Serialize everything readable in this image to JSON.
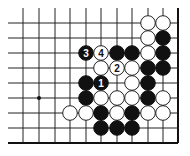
{
  "diagram": {
    "type": "go-board-fragment",
    "grid": {
      "columns_x": [
        23,
        39,
        55,
        70,
        86,
        101,
        117,
        132,
        148,
        163,
        178
      ],
      "rows_y": [
        8,
        23,
        38,
        53,
        68,
        83,
        98,
        113,
        128,
        143
      ],
      "right_edge_x": 178,
      "bottom_edge_y": 143
    },
    "star_points": [
      {
        "x": 39,
        "y": 98
      }
    ],
    "stones": [
      {
        "color": "white",
        "x": 148,
        "y": 23,
        "label": ""
      },
      {
        "color": "white",
        "x": 163,
        "y": 23,
        "label": ""
      },
      {
        "color": "white",
        "x": 148,
        "y": 38,
        "label": ""
      },
      {
        "color": "black",
        "x": 163,
        "y": 38,
        "label": ""
      },
      {
        "color": "black",
        "x": 86,
        "y": 53,
        "label": "3"
      },
      {
        "color": "white",
        "x": 101,
        "y": 53,
        "label": "4"
      },
      {
        "color": "black",
        "x": 117,
        "y": 53,
        "label": ""
      },
      {
        "color": "black",
        "x": 132,
        "y": 53,
        "label": ""
      },
      {
        "color": "white",
        "x": 148,
        "y": 53,
        "label": ""
      },
      {
        "color": "black",
        "x": 163,
        "y": 53,
        "label": ""
      },
      {
        "color": "white",
        "x": 101,
        "y": 68,
        "label": ""
      },
      {
        "color": "white",
        "x": 117,
        "y": 68,
        "label": "2"
      },
      {
        "color": "white",
        "x": 132,
        "y": 68,
        "label": ""
      },
      {
        "color": "black",
        "x": 148,
        "y": 68,
        "label": ""
      },
      {
        "color": "black",
        "x": 163,
        "y": 68,
        "label": ""
      },
      {
        "color": "black",
        "x": 86,
        "y": 83,
        "label": ""
      },
      {
        "color": "black",
        "x": 101,
        "y": 83,
        "label": "1"
      },
      {
        "color": "white",
        "x": 132,
        "y": 83,
        "label": ""
      },
      {
        "color": "black",
        "x": 148,
        "y": 83,
        "label": ""
      },
      {
        "color": "black",
        "x": 86,
        "y": 98,
        "label": ""
      },
      {
        "color": "white",
        "x": 101,
        "y": 98,
        "label": ""
      },
      {
        "color": "white",
        "x": 117,
        "y": 98,
        "label": ""
      },
      {
        "color": "white",
        "x": 132,
        "y": 98,
        "label": ""
      },
      {
        "color": "black",
        "x": 148,
        "y": 98,
        "label": ""
      },
      {
        "color": "white",
        "x": 163,
        "y": 98,
        "label": ""
      },
      {
        "color": "white",
        "x": 70,
        "y": 113,
        "label": ""
      },
      {
        "color": "white",
        "x": 86,
        "y": 113,
        "label": ""
      },
      {
        "color": "black",
        "x": 101,
        "y": 113,
        "label": ""
      },
      {
        "color": "white",
        "x": 117,
        "y": 113,
        "label": ""
      },
      {
        "color": "black",
        "x": 132,
        "y": 113,
        "label": ""
      },
      {
        "color": "white",
        "x": 148,
        "y": 113,
        "label": ""
      },
      {
        "color": "white",
        "x": 163,
        "y": 113,
        "label": ""
      },
      {
        "color": "black",
        "x": 101,
        "y": 128,
        "label": ""
      },
      {
        "color": "black",
        "x": 117,
        "y": 128,
        "label": ""
      },
      {
        "color": "black",
        "x": 132,
        "y": 128,
        "label": ""
      }
    ],
    "stone_radius": 7.3
  }
}
